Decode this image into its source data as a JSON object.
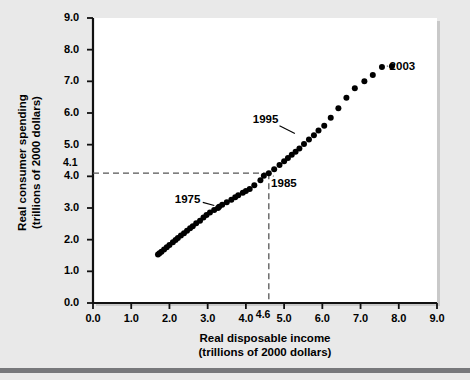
{
  "figure": {
    "name": "consumer-spending-vs-disposable-income-scatter",
    "background_color": "#e9e9e9",
    "plot_background_color": "#ffffff",
    "rule_color": "#77787b"
  },
  "chart_data": {
    "type": "scatter",
    "title": "",
    "xlabel_line1": "Real disposable income",
    "xlabel_line2": "(trillions of 2000 dollars)",
    "ylabel_line1": "Real consumer spending",
    "ylabel_line2": "(trillions of 2000 dollars)",
    "xlim": [
      0.0,
      9.0
    ],
    "ylim": [
      0.0,
      9.0
    ],
    "xticks": [
      "0.0",
      "1.0",
      "2.0",
      "3.0",
      "4.0",
      "5.0",
      "6.0",
      "7.0",
      "8.0",
      "9.0"
    ],
    "xtick_values": [
      0.0,
      1.0,
      2.0,
      3.0,
      4.0,
      5.0,
      6.0,
      7.0,
      8.0,
      9.0
    ],
    "yticks": [
      "0.0",
      "1.0",
      "2.0",
      "3.0",
      "4.0",
      "5.0",
      "6.0",
      "7.0",
      "8.0",
      "9.0"
    ],
    "ytick_values": [
      0.0,
      1.0,
      2.0,
      3.0,
      4.0,
      5.0,
      6.0,
      7.0,
      8.0,
      9.0
    ],
    "grid": false,
    "legend": false,
    "marker_color": "#000000",
    "marker_size": 3.0,
    "reference_lines": {
      "x_value": 4.6,
      "x_label": "4.6",
      "y_value": 4.1,
      "y_label": "4.1",
      "style": "dashed",
      "color": "#555555"
    },
    "x": [
      1.7,
      1.74,
      1.79,
      1.86,
      1.93,
      2.0,
      2.09,
      2.16,
      2.22,
      2.3,
      2.38,
      2.46,
      2.54,
      2.61,
      2.7,
      2.8,
      2.89,
      2.97,
      3.06,
      3.17,
      3.27,
      3.3,
      3.38,
      3.5,
      3.62,
      3.72,
      3.8,
      3.92,
      4.0,
      4.1,
      4.22,
      4.38,
      4.47,
      4.6,
      4.74,
      4.88,
      5.0,
      5.1,
      5.2,
      5.3,
      5.4,
      5.52,
      5.65,
      5.78,
      5.9,
      6.05,
      6.22,
      6.42,
      6.63,
      6.85,
      7.1,
      7.32,
      7.56,
      7.82
    ],
    "y": [
      1.53,
      1.57,
      1.62,
      1.69,
      1.76,
      1.83,
      1.92,
      1.99,
      2.05,
      2.13,
      2.2,
      2.28,
      2.36,
      2.42,
      2.52,
      2.6,
      2.7,
      2.78,
      2.86,
      2.94,
      3.0,
      3.04,
      3.1,
      3.18,
      3.26,
      3.34,
      3.4,
      3.48,
      3.54,
      3.6,
      3.72,
      3.88,
      4.02,
      4.1,
      4.22,
      4.36,
      4.48,
      4.58,
      4.68,
      4.78,
      4.88,
      5.02,
      5.16,
      5.3,
      5.45,
      5.6,
      5.85,
      6.15,
      6.48,
      6.78,
      7.0,
      7.2,
      7.45,
      7.48
    ],
    "annotations": [
      {
        "label": "1975",
        "text_x": 2.48,
        "text_y": 3.3,
        "point_x": 3.3,
        "point_y": 3.04,
        "leader": true
      },
      {
        "label": "1985",
        "text_x": 5.0,
        "text_y": 3.78,
        "point_x": 4.6,
        "point_y": 4.1,
        "leader": true
      },
      {
        "label": "1995",
        "text_x": 4.52,
        "text_y": 5.82,
        "point_x": 5.4,
        "point_y": 5.28,
        "leader": true
      },
      {
        "label": "2003",
        "text_x": 8.1,
        "text_y": 7.48,
        "point_x": 7.82,
        "point_y": 7.48,
        "leader": true
      }
    ]
  }
}
